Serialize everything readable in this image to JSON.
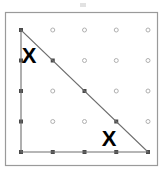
{
  "figure": {
    "title": "",
    "canvas": {
      "width": 164,
      "height": 174,
      "background": "#ffffff"
    },
    "frame": {
      "label": "outer border",
      "x": 5.5,
      "y": 12.5,
      "width": 152,
      "height": 153,
      "stroke": "#9a9a9a",
      "stroke_width": 1.2
    },
    "smudge": {
      "label": "faint top mark",
      "x": 80,
      "y": 3,
      "width": 6,
      "height": 4,
      "color": "#e2e2e2"
    }
  },
  "chart_data": {
    "type": "scatter",
    "title": "",
    "subtitle": "",
    "xlabel": "",
    "ylabel": "",
    "grid": false,
    "legend": null,
    "xlim": [
      0,
      4
    ],
    "ylim": [
      0,
      4
    ],
    "lattice": {
      "columns": 5,
      "rows": 5,
      "origin_px": {
        "x": 21,
        "y": 30
      },
      "spacing_px": {
        "x": 31.75,
        "y": 30.5
      },
      "dot_styles": {
        "boundary": {
          "shape": "filled-square",
          "size": 4,
          "color": "#4a4a4a"
        },
        "free": {
          "shape": "hollow-circle",
          "size": 4,
          "color": "#b0b0b0",
          "fill": "#ffffff"
        }
      },
      "points": [
        {
          "col": 0,
          "row": 0,
          "x": 0,
          "y": 4,
          "state": "boundary"
        },
        {
          "col": 1,
          "row": 0,
          "x": 1,
          "y": 4,
          "state": "free"
        },
        {
          "col": 2,
          "row": 0,
          "x": 2,
          "y": 4,
          "state": "free"
        },
        {
          "col": 3,
          "row": 0,
          "x": 3,
          "y": 4,
          "state": "free"
        },
        {
          "col": 4,
          "row": 0,
          "x": 4,
          "y": 4,
          "state": "free"
        },
        {
          "col": 0,
          "row": 1,
          "x": 0,
          "y": 3,
          "state": "boundary"
        },
        {
          "col": 1,
          "row": 1,
          "x": 1,
          "y": 3,
          "state": "boundary"
        },
        {
          "col": 2,
          "row": 1,
          "x": 2,
          "y": 3,
          "state": "free"
        },
        {
          "col": 3,
          "row": 1,
          "x": 3,
          "y": 3,
          "state": "free"
        },
        {
          "col": 4,
          "row": 1,
          "x": 4,
          "y": 3,
          "state": "free"
        },
        {
          "col": 0,
          "row": 2,
          "x": 0,
          "y": 2,
          "state": "boundary"
        },
        {
          "col": 1,
          "row": 2,
          "x": 1,
          "y": 2,
          "state": "free"
        },
        {
          "col": 2,
          "row": 2,
          "x": 2,
          "y": 2,
          "state": "boundary"
        },
        {
          "col": 3,
          "row": 2,
          "x": 3,
          "y": 2,
          "state": "free"
        },
        {
          "col": 4,
          "row": 2,
          "x": 4,
          "y": 2,
          "state": "free"
        },
        {
          "col": 0,
          "row": 3,
          "x": 0,
          "y": 1,
          "state": "boundary"
        },
        {
          "col": 1,
          "row": 3,
          "x": 1,
          "y": 1,
          "state": "free"
        },
        {
          "col": 2,
          "row": 3,
          "x": 2,
          "y": 1,
          "state": "free"
        },
        {
          "col": 3,
          "row": 3,
          "x": 3,
          "y": 1,
          "state": "boundary"
        },
        {
          "col": 4,
          "row": 3,
          "x": 4,
          "y": 1,
          "state": "free"
        },
        {
          "col": 0,
          "row": 4,
          "x": 0,
          "y": 0,
          "state": "boundary"
        },
        {
          "col": 1,
          "row": 4,
          "x": 1,
          "y": 0,
          "state": "boundary"
        },
        {
          "col": 2,
          "row": 4,
          "x": 2,
          "y": 0,
          "state": "boundary"
        },
        {
          "col": 3,
          "row": 4,
          "x": 3,
          "y": 0,
          "state": "boundary"
        },
        {
          "col": 4,
          "row": 4,
          "x": 4,
          "y": 0,
          "state": "boundary"
        }
      ]
    },
    "shapes": [
      {
        "name": "right-triangle",
        "type": "polygon",
        "closed": true,
        "stroke": "#6e6e6e",
        "stroke_width": 1.1,
        "fill": "none",
        "vertices_lattice": [
          {
            "x": 0,
            "y": 4
          },
          {
            "x": 0,
            "y": 0
          },
          {
            "x": 4,
            "y": 0
          }
        ],
        "vertices_px": [
          {
            "x": 21,
            "y": 30
          },
          {
            "x": 21,
            "y": 152
          },
          {
            "x": 148,
            "y": 152
          }
        ]
      }
    ],
    "annotations": [
      {
        "name": "x-mark-upper-left",
        "text": "X",
        "x_px": 29,
        "y_px": 55,
        "font_size": 22,
        "color": "#000000",
        "bold": true
      },
      {
        "name": "x-mark-lower-right",
        "text": "X",
        "x_px": 109,
        "y_px": 138,
        "font_size": 22,
        "color": "#000000",
        "bold": true
      }
    ]
  }
}
